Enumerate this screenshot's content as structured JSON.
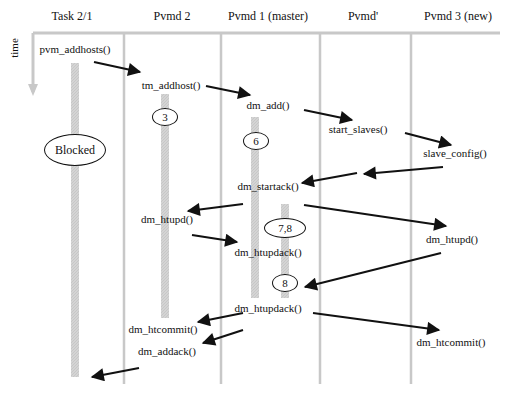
{
  "diagram": {
    "axis_label": "time",
    "columns": [
      {
        "id": "task",
        "label": "Task 2/1",
        "x": 72
      },
      {
        "id": "pvmd2",
        "label": "Pvmd 2",
        "x": 172
      },
      {
        "id": "pvmd1",
        "label": "Pvmd 1 (master)",
        "x": 268
      },
      {
        "id": "pvmdp",
        "label": "Pvmd'",
        "x": 363
      },
      {
        "id": "pvmd3",
        "label": "Pvmd 3 (new)",
        "x": 458
      }
    ],
    "messages": [
      {
        "label": "pvm_addhosts()",
        "x": 75,
        "y": 43
      },
      {
        "label": "tm_addhost()",
        "x": 171,
        "y": 79
      },
      {
        "label": "dm_add()",
        "x": 268,
        "y": 99
      },
      {
        "label": "start_slaves()",
        "x": 358,
        "y": 123
      },
      {
        "label": "slave_config()",
        "x": 455,
        "y": 147
      },
      {
        "label": "dm_startack()",
        "x": 268,
        "y": 187
      },
      {
        "label": "dm_htupd()",
        "x": 167,
        "y": 212
      },
      {
        "label": "dm_htupdack()",
        "x": 268,
        "y": 246
      },
      {
        "label": "dm_htupd()",
        "x": 452,
        "y": 233
      },
      {
        "label": "dm_htupdack()",
        "x": 268,
        "y": 302
      },
      {
        "label": "dm_htcommit()",
        "x": 163,
        "y": 322
      },
      {
        "label": "dm_htcommit()",
        "x": 451,
        "y": 335
      },
      {
        "label": "dm_addack()",
        "x": 167,
        "y": 345
      }
    ],
    "states": [
      {
        "label": "Blocked",
        "x": 75,
        "y": 150,
        "w": 60,
        "h": 30
      },
      {
        "label": "3",
        "x": 165,
        "y": 117,
        "w": 24,
        "h": 16
      },
      {
        "label": "6",
        "x": 256,
        "y": 141,
        "w": 24,
        "h": 16
      },
      {
        "label": "7,8",
        "x": 285,
        "y": 228,
        "w": 40,
        "h": 18
      },
      {
        "label": "8",
        "x": 285,
        "y": 283,
        "w": 24,
        "h": 16
      }
    ],
    "colors": {
      "lifeline": "#c8c8c8",
      "activation": "#cfcfcf",
      "arrow": "#111111",
      "text": "#111111"
    }
  }
}
